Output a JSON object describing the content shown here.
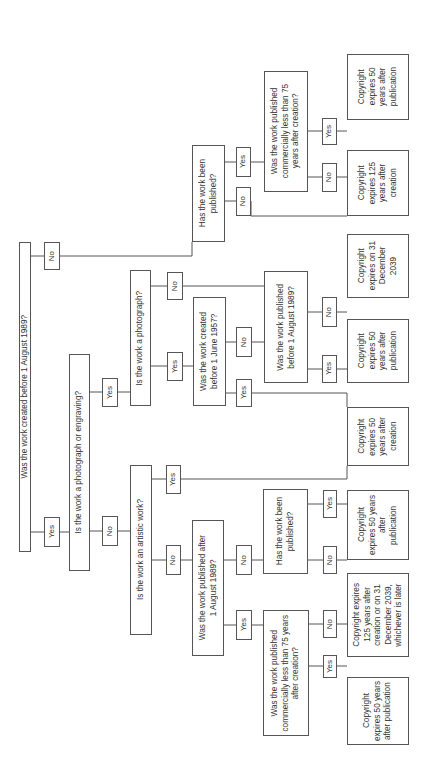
{
  "diagram": {
    "orientation": "rotated-90-ccw",
    "line_color": "#555555",
    "nodes": [
      {
        "id": "q-created-before-1989",
        "kind": "question",
        "text": "Was the work created before 1 August 1989?",
        "box": [
          19,
          242,
          31,
          552
        ]
      },
      {
        "id": "l-root-no",
        "kind": "label",
        "text": "No",
        "box": [
          44,
          242,
          60,
          270
        ]
      },
      {
        "id": "l-root-yes",
        "kind": "label",
        "text": "Yes",
        "box": [
          44,
          517,
          60,
          547
        ]
      },
      {
        "id": "q-photo-or-engraving",
        "kind": "question",
        "text": "Is the work a photograph or engraving?",
        "box": [
          69,
          354,
          90,
          571
        ]
      },
      {
        "id": "l-pe-yes",
        "kind": "label",
        "text": "Yes",
        "box": [
          102,
          378,
          118,
          407
        ]
      },
      {
        "id": "l-pe-no",
        "kind": "label",
        "text": "No",
        "box": [
          102,
          516,
          118,
          546
        ]
      },
      {
        "id": "q-photograph",
        "kind": "question",
        "text": "Is the work a photograph?",
        "box": [
          130,
          270,
          151,
          406
        ]
      },
      {
        "id": "l-ph-no",
        "kind": "label",
        "text": "No",
        "box": [
          167,
          272,
          183,
          300
        ]
      },
      {
        "id": "l-ph-yes",
        "kind": "label",
        "text": "Yes",
        "box": [
          167,
          352,
          183,
          381
        ]
      },
      {
        "id": "q-created-before-1957",
        "kind": "question",
        "text": "Was the work created\nbefore 1 June 1957?",
        "box": [
          193,
          297,
          226,
          406
        ]
      },
      {
        "id": "l-57-no",
        "kind": "label",
        "text": "No",
        "box": [
          236,
          327,
          252,
          357
        ]
      },
      {
        "id": "l-57-yes",
        "kind": "label",
        "text": "Yes",
        "box": [
          236,
          379,
          252,
          407
        ]
      },
      {
        "id": "q-published-before-1989",
        "kind": "question",
        "text": "Was the work published\nbefore 1 August 1989?",
        "box": [
          264,
          271,
          308,
          383
        ]
      },
      {
        "id": "l-pb-no",
        "kind": "label",
        "text": "No",
        "box": [
          322,
          297,
          337,
          327
        ]
      },
      {
        "id": "l-pb-yes",
        "kind": "label",
        "text": "Yes",
        "box": [
          322,
          355,
          337,
          383
        ]
      },
      {
        "id": "a-dec-2039",
        "kind": "answer",
        "text": "Copyright\nexpires on 31\nDecember\n2039",
        "box": [
          347,
          234,
          409,
          298
        ]
      },
      {
        "id": "a-50-pub-1",
        "kind": "answer",
        "text": "Copyright\nexpires 50\nyears after\npublication",
        "box": [
          347,
          319,
          409,
          383
        ]
      },
      {
        "id": "a-50-creation",
        "kind": "answer",
        "text": "Copyright\nexpires 50\nyears after\ncreation",
        "box": [
          347,
          407,
          409,
          466
        ]
      },
      {
        "id": "q-artistic",
        "kind": "question",
        "text": "Is the work an artistic work?",
        "box": [
          130,
          465,
          152,
          635
        ]
      },
      {
        "id": "l-art-yes",
        "kind": "label",
        "text": "Yes",
        "box": [
          166,
          465,
          181,
          494
        ]
      },
      {
        "id": "l-art-no",
        "kind": "label",
        "text": "No",
        "box": [
          166,
          545,
          181,
          575
        ]
      },
      {
        "id": "q-published-after-1989",
        "kind": "question",
        "text": "Was the work published after\n1 August 1989?",
        "box": [
          192,
          520,
          224,
          656
        ]
      },
      {
        "id": "l-pa-no",
        "kind": "label",
        "text": "No",
        "box": [
          236,
          545,
          252,
          575
        ]
      },
      {
        "id": "l-pa-yes",
        "kind": "label",
        "text": "Yes",
        "box": [
          236,
          610,
          252,
          640
        ]
      },
      {
        "id": "q-has-been-published-2",
        "kind": "question",
        "text": "Has the work been\npublished?",
        "box": [
          263,
          489,
          308,
          574
        ]
      },
      {
        "id": "l-hp2-yes",
        "kind": "label",
        "text": "Yes",
        "box": [
          323,
          490,
          337,
          518
        ]
      },
      {
        "id": "l-hp2-no",
        "kind": "label",
        "text": "No",
        "box": [
          323,
          546,
          337,
          574
        ]
      },
      {
        "id": "a-50-pub-2",
        "kind": "answer",
        "text": "Copyright\nexpires 50 years\nafter\npublication",
        "box": [
          347,
          490,
          409,
          560
        ]
      },
      {
        "id": "a-125-or-2039",
        "kind": "answer",
        "text": "Copyright expires\n125 years after\ncreation or on 31\nDecember 2039,\nwhichever is later",
        "box": [
          347,
          573,
          409,
          657
        ]
      },
      {
        "id": "q-commercial-75-2",
        "kind": "question",
        "text": "Was the work published\ncommercially less than 75 years\nafter creation?",
        "box": [
          263,
          610,
          309,
          736
        ]
      },
      {
        "id": "l-c2-no",
        "kind": "label",
        "text": "No",
        "box": [
          323,
          610,
          337,
          638
        ]
      },
      {
        "id": "l-c2-yes",
        "kind": "label",
        "text": "Yes",
        "box": [
          323,
          655,
          337,
          678
        ]
      },
      {
        "id": "a-50-pub-3",
        "kind": "answer",
        "text": "Copyright\nexpires 50 years\nafter publication",
        "box": [
          347,
          677,
          409,
          745
        ]
      },
      {
        "id": "q-has-been-published-1",
        "kind": "question",
        "text": "Has the work been\npublished?",
        "box": [
          192,
          145,
          225,
          242
        ]
      },
      {
        "id": "l-hp1-yes",
        "kind": "label",
        "text": "Yes",
        "box": [
          236,
          147,
          251,
          177
        ]
      },
      {
        "id": "l-hp1-no",
        "kind": "label",
        "text": "No",
        "box": [
          236,
          187,
          251,
          216
        ]
      },
      {
        "id": "q-commercial-75-1",
        "kind": "question",
        "text": "Was the work published\ncommercially less than 75\nyears after creation?",
        "box": [
          264,
          71,
          308,
          192
        ]
      },
      {
        "id": "l-c1-yes",
        "kind": "label",
        "text": "Yes",
        "box": [
          322,
          118,
          337,
          145
        ]
      },
      {
        "id": "l-c1-no",
        "kind": "label",
        "text": "No",
        "box": [
          322,
          163,
          337,
          192
        ]
      },
      {
        "id": "a-50-pub-4",
        "kind": "answer",
        "text": "Copyright\nexpires 50\nyears after\npublication",
        "box": [
          347,
          54,
          409,
          120
        ]
      },
      {
        "id": "a-125-creation",
        "kind": "answer",
        "text": "Copyright\nexpires 125\nyears after\ncreation",
        "box": [
          347,
          150,
          409,
          216
        ]
      }
    ],
    "connectors": [
      [
        [
          31,
          256
        ],
        [
          44,
          256
        ]
      ],
      [
        [
          60,
          256
        ],
        [
          192,
          256
        ],
        [
          192,
          242
        ]
      ],
      [
        [
          31,
          532
        ],
        [
          44,
          532
        ]
      ],
      [
        [
          60,
          532
        ],
        [
          69,
          532
        ]
      ],
      [
        [
          90,
          392
        ],
        [
          102,
          392
        ]
      ],
      [
        [
          118,
          392
        ],
        [
          130,
          392
        ]
      ],
      [
        [
          90,
          531
        ],
        [
          102,
          531
        ]
      ],
      [
        [
          118,
          531
        ],
        [
          130,
          531
        ]
      ],
      [
        [
          151,
          286
        ],
        [
          167,
          286
        ]
      ],
      [
        [
          183,
          286
        ],
        [
          264,
          286
        ]
      ],
      [
        [
          151,
          366
        ],
        [
          167,
          366
        ]
      ],
      [
        [
          183,
          366
        ],
        [
          193,
          366
        ]
      ],
      [
        [
          226,
          342
        ],
        [
          236,
          342
        ]
      ],
      [
        [
          252,
          342
        ],
        [
          264,
          342
        ]
      ],
      [
        [
          226,
          393
        ],
        [
          236,
          393
        ]
      ],
      [
        [
          252,
          393
        ],
        [
          347,
          393
        ],
        [
          347,
          407
        ]
      ],
      [
        [
          308,
          312
        ],
        [
          322,
          312
        ]
      ],
      [
        [
          337,
          312
        ],
        [
          347,
          312
        ]
      ],
      [
        [
          308,
          369
        ],
        [
          322,
          369
        ]
      ],
      [
        [
          337,
          369
        ],
        [
          347,
          369
        ]
      ],
      [
        [
          152,
          479
        ],
        [
          166,
          479
        ]
      ],
      [
        [
          181,
          479
        ],
        [
          347,
          479
        ],
        [
          347,
          466
        ]
      ],
      [
        [
          152,
          560
        ],
        [
          166,
          560
        ]
      ],
      [
        [
          181,
          560
        ],
        [
          192,
          560
        ]
      ],
      [
        [
          224,
          560
        ],
        [
          236,
          560
        ]
      ],
      [
        [
          252,
          560
        ],
        [
          263,
          560
        ]
      ],
      [
        [
          224,
          625
        ],
        [
          236,
          625
        ]
      ],
      [
        [
          252,
          625
        ],
        [
          263,
          625
        ]
      ],
      [
        [
          308,
          504
        ],
        [
          323,
          504
        ]
      ],
      [
        [
          337,
          504
        ],
        [
          347,
          504
        ]
      ],
      [
        [
          308,
          560
        ],
        [
          323,
          560
        ]
      ],
      [
        [
          337,
          560
        ],
        [
          347,
          560
        ]
      ],
      [
        [
          309,
          624
        ],
        [
          323,
          624
        ]
      ],
      [
        [
          337,
          624
        ],
        [
          347,
          624
        ]
      ],
      [
        [
          309,
          666
        ],
        [
          323,
          666
        ]
      ],
      [
        [
          337,
          666
        ],
        [
          347,
          666
        ]
      ],
      [
        [
          225,
          162
        ],
        [
          236,
          162
        ]
      ],
      [
        [
          251,
          162
        ],
        [
          264,
          162
        ]
      ],
      [
        [
          225,
          201
        ],
        [
          236,
          201
        ]
      ],
      [
        [
          251,
          201
        ],
        [
          251,
          216
        ],
        [
          347,
          216
        ]
      ],
      [
        [
          308,
          131
        ],
        [
          322,
          131
        ]
      ],
      [
        [
          337,
          131
        ],
        [
          347,
          131
        ]
      ],
      [
        [
          308,
          177
        ],
        [
          322,
          177
        ]
      ],
      [
        [
          337,
          177
        ],
        [
          347,
          177
        ]
      ]
    ]
  }
}
